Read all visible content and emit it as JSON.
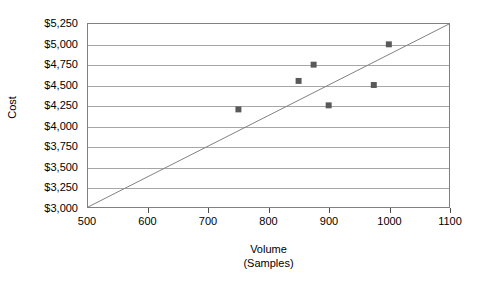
{
  "chart_data": {
    "type": "scatter",
    "title": "",
    "xlabel": "Volume",
    "xlabel_sub": "(Samples)",
    "ylabel": "Cost",
    "xlim": [
      500,
      1100
    ],
    "ylim": [
      3000,
      5250
    ],
    "xticks": [
      500,
      600,
      700,
      800,
      900,
      1000,
      1100
    ],
    "xtick_labels": [
      "500",
      "600",
      "700",
      "800",
      "900",
      "1000",
      "1100"
    ],
    "yticks": [
      3000,
      3250,
      3500,
      3750,
      4000,
      4250,
      4500,
      4750,
      5000,
      5250
    ],
    "ytick_labels": [
      "$3,000",
      "$3,250",
      "$3,500",
      "$3,750",
      "$4,000",
      "$4,250",
      "$4,500",
      "$4,750",
      "$5,000",
      "$5,250"
    ],
    "grid": true,
    "grid_axis": "y",
    "legend": false,
    "marker_color": "#595959",
    "marker_shape": "square",
    "grid_color": "#a6a6a6",
    "border_color": "#808080",
    "line_color": "#808080",
    "points": [
      {
        "x": 750,
        "y": 4200
      },
      {
        "x": 850,
        "y": 4550
      },
      {
        "x": 875,
        "y": 4750
      },
      {
        "x": 900,
        "y": 4250
      },
      {
        "x": 975,
        "y": 4500
      },
      {
        "x": 1000,
        "y": 5000
      }
    ],
    "reference_line": {
      "name": "diagonal-reference-line",
      "from": {
        "x": 500,
        "y": 3000
      },
      "to": {
        "x": 1100,
        "y": 5250
      }
    }
  }
}
